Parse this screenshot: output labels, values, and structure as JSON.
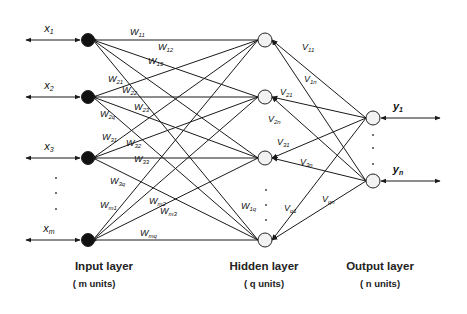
{
  "diagram": {
    "type": "neural-network",
    "layers": {
      "input": {
        "title": "Input layer",
        "units_label": "( m units)",
        "nodes": [
          {
            "label": "x1",
            "main": "x",
            "sub": "1",
            "y": 40
          },
          {
            "label": "x2",
            "main": "x",
            "sub": "2",
            "y": 97
          },
          {
            "label": "x3",
            "main": "x",
            "sub": "3",
            "y": 158
          },
          {
            "label": "xm",
            "main": "x",
            "sub": "m",
            "y": 240
          }
        ],
        "node_x": 88,
        "fill": "#111111"
      },
      "hidden": {
        "title": "Hidden  layer",
        "units_label": "( q units)",
        "nodes_y": [
          40,
          97,
          158,
          240
        ],
        "node_x": 265,
        "fill": "#f2f2f2"
      },
      "output": {
        "title": "Output layer",
        "units_label": "( n units)",
        "nodes": [
          {
            "label": "y1",
            "main": "y",
            "sub": "1",
            "y": 118
          },
          {
            "label": "yn",
            "main": "y",
            "sub": "n",
            "y": 181
          }
        ],
        "node_x": 373,
        "fill": "#f2f2f2"
      }
    },
    "weights_input_hidden": [
      {
        "main": "W",
        "sub": "11",
        "x": 130,
        "y": 35
      },
      {
        "main": "W",
        "sub": "12",
        "x": 158,
        "y": 50
      },
      {
        "main": "W",
        "sub": "13",
        "x": 148,
        "y": 64
      },
      {
        "main": "W",
        "sub": "21",
        "x": 108,
        "y": 82
      },
      {
        "main": "W",
        "sub": "22",
        "x": 122,
        "y": 93
      },
      {
        "main": "W",
        "sub": "23",
        "x": 134,
        "y": 110
      },
      {
        "main": "W",
        "sub": "2q",
        "x": 100,
        "y": 117
      },
      {
        "main": "W",
        "sub": "31",
        "x": 102,
        "y": 140
      },
      {
        "main": "W",
        "sub": "32",
        "x": 126,
        "y": 146
      },
      {
        "main": "W",
        "sub": "33",
        "x": 134,
        "y": 162
      },
      {
        "main": "W",
        "sub": "3q",
        "x": 110,
        "y": 184
      },
      {
        "main": "W",
        "sub": "m1",
        "x": 100,
        "y": 208
      },
      {
        "main": "W",
        "sub": "m2",
        "x": 149,
        "y": 204
      },
      {
        "main": "W",
        "sub": "m3",
        "x": 160,
        "y": 214
      },
      {
        "main": "W",
        "sub": "mq",
        "x": 140,
        "y": 236
      },
      {
        "main": "W",
        "sub": "1q",
        "x": 241,
        "y": 209
      }
    ],
    "weights_hidden_output": [
      {
        "main": "V",
        "sub": "11",
        "x": 302,
        "y": 50
      },
      {
        "main": "V",
        "sub": "1n",
        "x": 304,
        "y": 82
      },
      {
        "main": "V",
        "sub": "21",
        "x": 280,
        "y": 95
      },
      {
        "main": "V",
        "sub": "2n",
        "x": 268,
        "y": 122
      },
      {
        "main": "V",
        "sub": "31",
        "x": 277,
        "y": 145
      },
      {
        "main": "V",
        "sub": "3n",
        "x": 300,
        "y": 165
      },
      {
        "main": "V",
        "sub": "q1",
        "x": 284,
        "y": 211
      },
      {
        "main": "V",
        "sub": "qn",
        "x": 322,
        "y": 202
      }
    ],
    "ellipsis_dots": {
      "input": {
        "x": 56,
        "ys": [
          178,
          193,
          209
        ]
      },
      "hidden": {
        "x": 266,
        "ys": [
          190,
          205,
          220
        ]
      },
      "output": {
        "x": 373,
        "ys": [
          135,
          148,
          164
        ]
      }
    },
    "colors": {
      "line": "#1a1a1a",
      "input_node": "#111111",
      "hidden_node_fill": "#f4f4f4",
      "node_stroke": "#222222",
      "background": "#ffffff"
    }
  }
}
